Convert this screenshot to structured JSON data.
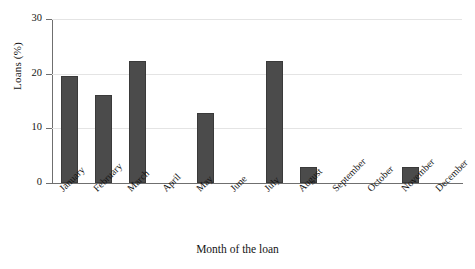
{
  "chart_data": {
    "type": "bar",
    "title": "",
    "xlabel": "Month of the loan",
    "ylabel": "Loans (%)",
    "categories": [
      "January",
      "February",
      "March",
      "April",
      "May",
      "June",
      "July",
      "August",
      "September",
      "October",
      "November",
      "December"
    ],
    "values": [
      19.5,
      16.1,
      22.3,
      0,
      12.8,
      0,
      22.3,
      3.0,
      0,
      0,
      3.0,
      0
    ],
    "ylim": [
      0,
      30
    ],
    "yticks": [
      0,
      10,
      20,
      30
    ],
    "ytick_labels": [
      "0",
      "10",
      "20",
      "30"
    ],
    "grid": true,
    "legend": "none",
    "bar_color": "#4b4b4b",
    "bar_edge_color": "#3a3a3a",
    "grid_color": "#e4e4e4",
    "axis_color": "#6f6f6f"
  }
}
